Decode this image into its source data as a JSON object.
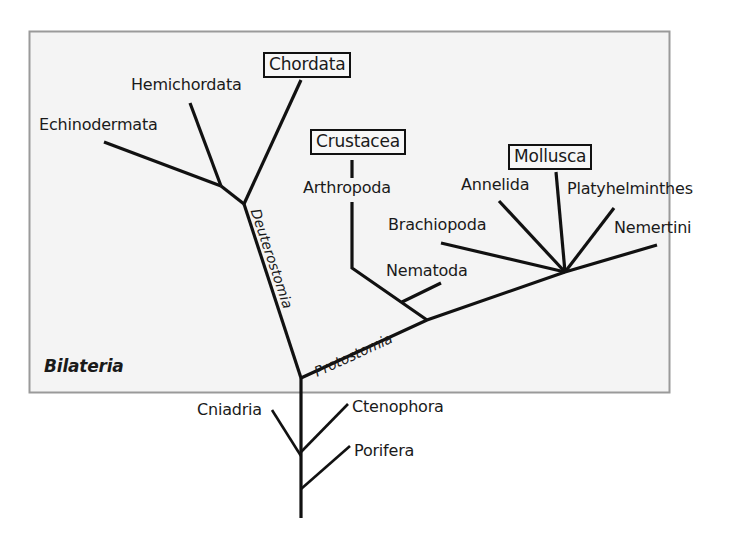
{
  "figure": {
    "group_label": "Bilateria",
    "colors": {
      "background": "#ffffff",
      "panel_fill": "#f4f4f4",
      "panel_border": "#9a9a9a",
      "branch": "#111111",
      "text": "#1a1a1a"
    }
  },
  "branch_labels": {
    "deuterostomia": "Deuterostomia",
    "protostomia": "Protostomia"
  },
  "taxa": {
    "chordata": "Chordata",
    "hemichordata": "Hemichordata",
    "echinodermata": "Echinodermata",
    "crustacea": "Crustacea",
    "arthropoda": "Arthropoda",
    "nematoda": "Nematoda",
    "mollusca": "Mollusca",
    "annelida": "Annelida",
    "platyhelminthes": "Platyhelminthes",
    "brachiopoda": "Brachiopoda",
    "nemertini": "Nemertini",
    "cniadria": "Cniadria",
    "ctenophora": "Ctenophora",
    "porifera": "Porifera"
  },
  "highlighted_taxa": [
    "Chordata",
    "Crustacea",
    "Mollusca"
  ]
}
